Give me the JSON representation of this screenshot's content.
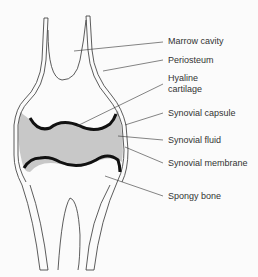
{
  "diagram": {
    "colors": {
      "fluid": "#c8c8c8",
      "line": "#333333",
      "cartilage": "#111111",
      "background": "#fbfbfb"
    },
    "labels": [
      {
        "id": "marrow-cavity",
        "text": "Marrow cavity"
      },
      {
        "id": "periosteum",
        "text": "Periosteum"
      },
      {
        "id": "hyaline-cartilage-1",
        "text": "Hyaline"
      },
      {
        "id": "hyaline-cartilage-2",
        "text": "cartilage"
      },
      {
        "id": "synovial-capsule",
        "text": "Synovial capsule"
      },
      {
        "id": "synovial-fluid",
        "text": "Synovial fluid"
      },
      {
        "id": "synovial-membrane",
        "text": "Synovial membrane"
      },
      {
        "id": "spongy-bone",
        "text": "Spongy bone"
      }
    ]
  }
}
